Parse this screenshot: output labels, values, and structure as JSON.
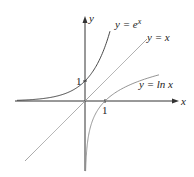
{
  "chart_data": {
    "type": "line",
    "title": "",
    "xlabel": "x",
    "ylabel": "y",
    "xlim": [
      -3.5,
      4.6
    ],
    "ylim": [
      -3.5,
      4.2
    ],
    "grid": false,
    "ticks": {
      "x": [
        "1"
      ],
      "y": [
        "1"
      ]
    },
    "series": [
      {
        "name": "y = e^x",
        "label_main": "y = e",
        "label_sup": "x",
        "function": "exp",
        "x_range": [
          -3.4,
          1.25
        ],
        "color": "#333333"
      },
      {
        "name": "y = x",
        "label_main": "y = x",
        "function": "identity",
        "x_range": [
          -3.0,
          3.1
        ],
        "color": "#999999"
      },
      {
        "name": "y = ln x",
        "label_main": "y = ln x",
        "function": "ln",
        "x_range": [
          0.02,
          3.7
        ],
        "color": "#888888"
      }
    ]
  }
}
